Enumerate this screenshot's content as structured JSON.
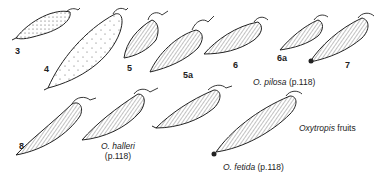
{
  "figure": {
    "title_italic": "Oxytropis",
    "title_rest": " fruits",
    "figure_numbers": [
      "3",
      "4",
      "5",
      "5a",
      "6",
      "6a",
      "7",
      "8"
    ],
    "species_labels": [
      {
        "name": "O. pilosa",
        "page": "(p.118)"
      },
      {
        "name": "O. halleri",
        "page": "(p.118)"
      },
      {
        "name": "O. fetida",
        "page": "(p.118)"
      }
    ]
  },
  "colors": {
    "ink": "#1a1a1a",
    "background": "#ffffff"
  }
}
